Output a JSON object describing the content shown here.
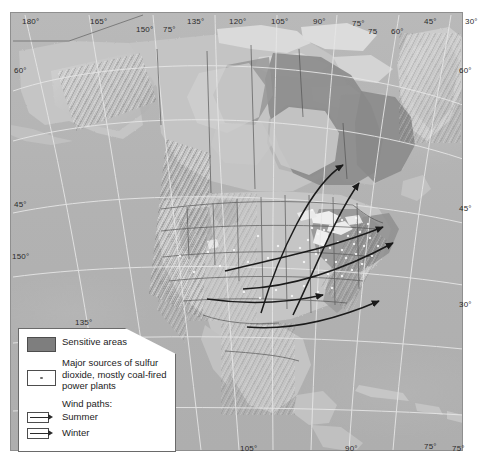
{
  "map": {
    "title": "Acid rain sensitivity and sulfur dioxide sources, North America",
    "projection_note": "",
    "colors": {
      "ocean": "#b4b4b4",
      "land": "#c3c3c3",
      "sensitive_area": "#8e8e8e",
      "ice_pale": "#d8d8d8",
      "graticule": "#e2e2e2",
      "border": "#5a5a5a",
      "wind_path": "#1f1f1f",
      "legend_background": "#ffffff",
      "legend_border": "#6a6a6a",
      "text": "#1c1c1c"
    },
    "graticule_labels": {
      "top": [
        {
          "text": "180°",
          "x": 22,
          "y": 17
        },
        {
          "text": "165°",
          "x": 90,
          "y": 17
        },
        {
          "text": "150°",
          "x": 136,
          "y": 25
        },
        {
          "text": "75°",
          "x": 163,
          "y": 25
        },
        {
          "text": "135°",
          "x": 187,
          "y": 17
        },
        {
          "text": "120°",
          "x": 229,
          "y": 17
        },
        {
          "text": "105°",
          "x": 271,
          "y": 17
        },
        {
          "text": "90°",
          "x": 313,
          "y": 17
        },
        {
          "text": "75°",
          "x": 352,
          "y": 19
        },
        {
          "text": "75",
          "x": 368,
          "y": 27
        },
        {
          "text": "60°",
          "x": 391,
          "y": 27
        },
        {
          "text": "45°",
          "x": 424,
          "y": 17
        },
        {
          "text": "30°",
          "x": 465,
          "y": 17
        }
      ],
      "left": [
        {
          "text": "60°",
          "x": 14,
          "y": 66
        },
        {
          "text": "45°",
          "x": 14,
          "y": 200
        },
        {
          "text": "150°",
          "x": 12,
          "y": 252
        }
      ],
      "right": [
        {
          "text": "60°",
          "x": 459,
          "y": 66
        },
        {
          "text": "45°",
          "x": 459,
          "y": 204
        },
        {
          "text": "30°",
          "x": 459,
          "y": 300
        },
        {
          "text": "75°",
          "x": 452,
          "y": 444
        }
      ],
      "bottom": [
        {
          "text": "135°",
          "x": 75,
          "y": 318
        },
        {
          "text": "105°",
          "x": 240,
          "y": 444
        },
        {
          "text": "90°",
          "x": 345,
          "y": 444
        },
        {
          "text": "75°",
          "x": 424,
          "y": 442
        }
      ]
    }
  },
  "legend": {
    "items": [
      {
        "id": "sensitive-areas",
        "swatch": "filled-rectangle",
        "label": "Sensitive areas"
      },
      {
        "id": "so2-sources",
        "swatch": "dot-in-box",
        "label": "Major sources of sulfur dioxide, mostly coal-fired power plants"
      }
    ],
    "wind_paths_heading": "Wind paths:",
    "wind_paths": [
      {
        "id": "summer",
        "swatch": "arrow",
        "label": "Summer"
      },
      {
        "id": "winter",
        "swatch": "arrow",
        "label": "Winter"
      }
    ]
  },
  "chart_data": {
    "type": "map",
    "sensitive_regions": [
      "Canadian Shield (central/eastern Canada)",
      "Great Lakes region",
      "Northeastern United States / New England",
      "Appalachian highlands",
      "Eastern Canada / Quebec / Labrador"
    ],
    "wind_path_count": 6,
    "so2_source_cluster": "Ohio River Valley / Great Lakes / Appalachians"
  }
}
